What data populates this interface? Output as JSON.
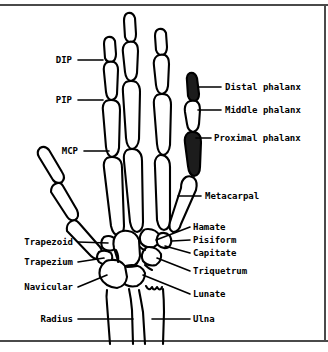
{
  "figure": {
    "colors": {
      "ink": "#000000",
      "paper": "#ffffff",
      "rule": "#4a4a4a",
      "highlight_fill": "#1c1c1c"
    }
  },
  "labels_left": [
    {
      "id": "dip",
      "text": "DIP",
      "x": 72,
      "y": 63,
      "tick_x1": 78,
      "tick_x2": 103,
      "tick_y": 60
    },
    {
      "id": "pip",
      "text": "PIP",
      "x": 72,
      "y": 103,
      "tick_x1": 78,
      "tick_x2": 103,
      "tick_y": 100
    },
    {
      "id": "mcp",
      "text": "MCP",
      "x": 78,
      "y": 154,
      "tick_x1": 84,
      "tick_x2": 109,
      "tick_y": 151
    },
    {
      "id": "trapezoid",
      "text": "Trapezoid",
      "x": 73,
      "y": 245,
      "tick_x1": 78,
      "tick_x2": 125,
      "tick_y": 242
    },
    {
      "id": "trapezium",
      "text": "Trapezium",
      "x": 73,
      "y": 265,
      "tick_x1": 78,
      "tick_x2": 118,
      "tick_y": 262
    },
    {
      "id": "navicular",
      "text": "Navicular",
      "x": 73,
      "y": 290,
      "tick_x1": 78,
      "tick_x2": 124,
      "tick_y": 287
    },
    {
      "id": "radius",
      "text": "Radius",
      "x": 73,
      "y": 322,
      "tick_x1": 80,
      "tick_x2": 133,
      "tick_y": 319
    }
  ],
  "labels_right": [
    {
      "id": "distal-phalanx",
      "text": "Distal phalanx",
      "x": 225,
      "y": 90,
      "tick_x1": 205,
      "tick_x2": 221,
      "tick_y": 87
    },
    {
      "id": "middle-phalanx",
      "text": "Middle phalanx",
      "x": 225,
      "y": 113,
      "tick_x1": 202,
      "tick_x2": 221,
      "tick_y": 110
    },
    {
      "id": "proximal-phalanx",
      "text": "Proximal phalanx",
      "x": 214,
      "y": 141,
      "tick_x1": 196,
      "tick_x2": 211,
      "tick_y": 138
    },
    {
      "id": "metacarpal",
      "text": "Metacarpal",
      "x": 205,
      "y": 199,
      "tick_x1": 178,
      "tick_x2": 201,
      "tick_y": 196
    },
    {
      "id": "hamate",
      "text": "Hamate",
      "x": 193,
      "y": 230,
      "tick_x1": 175,
      "tick_x2": 190,
      "tick_y": 227
    },
    {
      "id": "pisiform",
      "text": "Pisiform",
      "x": 193,
      "y": 243,
      "tick_x1": 174,
      "tick_x2": 190,
      "tick_y": 240
    },
    {
      "id": "capitate",
      "text": "Capitate",
      "x": 193,
      "y": 256,
      "tick_x1": 174,
      "tick_x2": 190,
      "tick_y": 253
    },
    {
      "id": "triquetrum",
      "text": "Triquetrum",
      "x": 193,
      "y": 274,
      "tick_x1": 175,
      "tick_x2": 190,
      "tick_y": 271
    },
    {
      "id": "lunate",
      "text": "Lunate",
      "x": 193,
      "y": 297,
      "tick_x1": 176,
      "tick_x2": 190,
      "tick_y": 294
    },
    {
      "id": "ulna",
      "text": "Ulna",
      "x": 193,
      "y": 322,
      "tick_x1": 158,
      "tick_x2": 190,
      "tick_y": 319
    }
  ]
}
